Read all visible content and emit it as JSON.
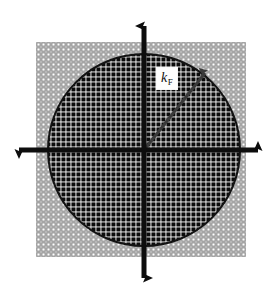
{
  "figure": {
    "caption_label": "Fermi circle in k-space",
    "background_color": "#ffffff"
  },
  "annotations": {
    "kf": {
      "symbol": "k",
      "subscript": "F",
      "box_background": "#fdfdfd",
      "text_color": "#111111"
    }
  },
  "axes": {
    "color": "#0d0d0d",
    "center": {
      "x": 144,
      "y": 150
    },
    "horizontal": {
      "x_start": 12,
      "x_end": 262,
      "y": 150
    },
    "vertical": {
      "y_start": 18,
      "y_end": 286,
      "x": 144
    },
    "arrowheads": [
      "up",
      "down",
      "left",
      "right"
    ]
  },
  "fermi_circle": {
    "center_x": 144,
    "center_y": 150,
    "radius": 96,
    "stroke_color": "#121212",
    "stroke_width": 2
  },
  "kf_arrow": {
    "from_x": 144,
    "from_y": 150,
    "to_x": 205,
    "to_y": 73,
    "color": "#3a3a3a"
  },
  "lattice": {
    "cell_size": 5,
    "left": 36,
    "top": 42,
    "right": 249,
    "bottom": 257,
    "occupied_color": "#0b0b0b",
    "unoccupied_color": "#8f8f8f",
    "gap_color": "#ffffff",
    "occupied_description": "filled states inside Fermi circle",
    "unoccupied_description": "empty states outside Fermi circle"
  },
  "chart_data": {
    "type": "scatter",
    "xlabel": "",
    "ylabel": "",
    "annotations": [
      "k_F"
    ],
    "series": [
      {
        "name": "occupied states (inside Fermi circle)",
        "marker": "filled square",
        "color": "#0b0b0b",
        "count_approx": 1180
      },
      {
        "name": "unoccupied states (outside Fermi circle)",
        "marker": "open square",
        "color": "#8f8f8f",
        "count_approx": 660
      }
    ],
    "circle": {
      "center": [
        0,
        0
      ],
      "radius_label": "k_F",
      "radius_px": 96
    },
    "grid": true,
    "legend": "none"
  }
}
